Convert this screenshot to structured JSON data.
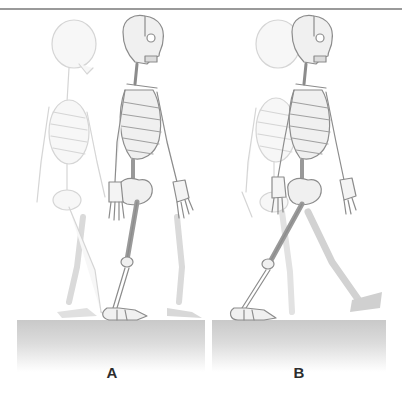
{
  "figure": {
    "panels": [
      {
        "id": "A",
        "label": "A"
      },
      {
        "id": "B",
        "label": "B"
      }
    ],
    "colors": {
      "rule": "#9a9a9a",
      "bone_fill": "#efefef",
      "bone_stroke": "#8c8c8c",
      "ghost_stroke": "#d2d2d2",
      "shadow": "#cfcfcf",
      "floor_top": "#c9c9c9",
      "label": "#2d2d2d"
    }
  }
}
